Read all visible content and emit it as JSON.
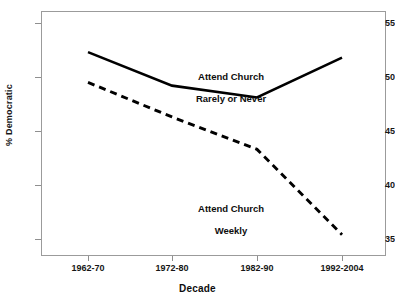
{
  "chart_data": {
    "type": "line",
    "title": "",
    "xlabel": "Decade",
    "ylabel": "% Democratic",
    "categories": [
      "1962-70",
      "1972-80",
      "1982-90",
      "1992-2004"
    ],
    "ylim": [
      34,
      56.5
    ],
    "yticks": [
      35,
      40,
      45,
      50,
      55
    ],
    "ytick_labels": [
      "35",
      "40",
      "45",
      "50",
      "55"
    ],
    "grid": false,
    "legend_position": "inline-annotations",
    "series": [
      {
        "name": "Attend Church Rarely or Never",
        "style": "solid",
        "color": "#000000",
        "values": [
          52.3,
          49.2,
          48.1,
          51.8
        ],
        "annotation": "Attend Church\nRarely or Never"
      },
      {
        "name": "Attend Church Weekly",
        "style": "dashed",
        "color": "#000000",
        "values": [
          49.5,
          46.3,
          43.3,
          35.4
        ],
        "annotation": "Attend Church\nWeekly"
      }
    ]
  },
  "axes": {
    "y_title": "% Democratic",
    "x_title": "Decade",
    "y_tick_0": "35",
    "y_tick_1": "40",
    "y_tick_2": "45",
    "y_tick_3": "50",
    "y_tick_4": "55",
    "x_tick_0": "1962-70",
    "x_tick_1": "1972-80",
    "x_tick_2": "1982-90",
    "x_tick_3": "1992-2004"
  },
  "annotations": {
    "solid_line_label_line1": "Attend Church",
    "solid_line_label_line2": "Rarely or Never",
    "dashed_line_label_line1": "Attend Church",
    "dashed_line_label_line2": "Weekly"
  },
  "colors": {
    "line": "#000000",
    "frame": "#9b9b9b",
    "text": "#0d0d0d",
    "background": "#ffffff"
  }
}
